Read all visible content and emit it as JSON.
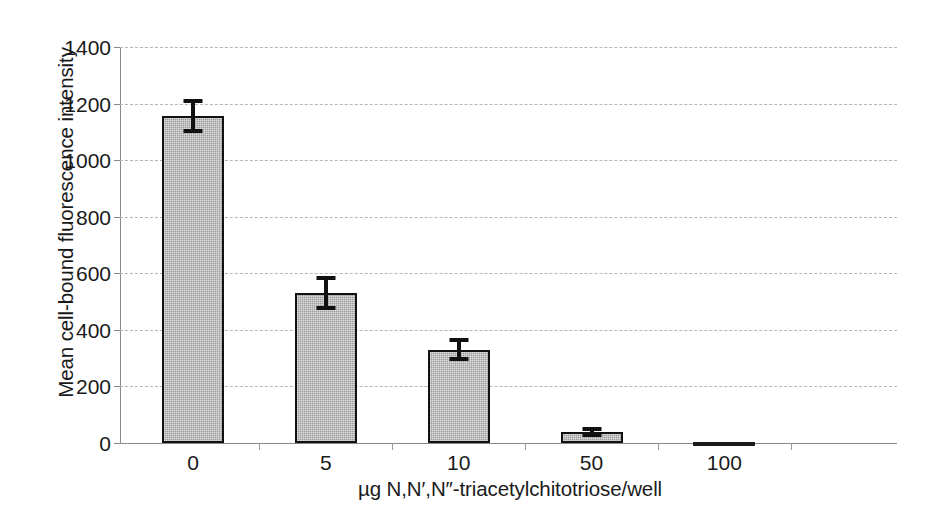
{
  "chart_data": {
    "type": "bar",
    "title": "",
    "xlabel": "µg N,N′,N″-triacetylchitotriose/well",
    "ylabel": "Mean cell-bound fluorescence intensity",
    "categories": [
      "0",
      "5",
      "10",
      "50",
      "100"
    ],
    "values": [
      1155,
      530,
      330,
      40,
      5
    ],
    "errors": [
      60,
      60,
      40,
      18,
      5
    ],
    "error_low": [
      1095,
      470,
      290,
      22,
      0
    ],
    "error_high": [
      1215,
      590,
      370,
      58,
      10
    ],
    "ylim": [
      0,
      1400
    ],
    "yticks": [
      0,
      200,
      400,
      600,
      800,
      1000,
      1200,
      1400
    ],
    "ytick_labels": [
      "0",
      "200",
      "400",
      "600",
      "800",
      "1000",
      "1200",
      "1400"
    ],
    "grid": true,
    "grid_axis": "y",
    "grid_style": "dashed",
    "legend": false,
    "legend_position": "none",
    "bar_fill_color": "#9c9c9c",
    "bar_edge_color": "#111111",
    "grid_color": "#b6b6b6",
    "axis_color": "#8a8a8a",
    "background_color": "#ffffff",
    "series": [
      {
        "name": "Mean cell-bound fluorescence intensity",
        "values": [
          1155,
          530,
          330,
          40,
          5
        ]
      }
    ]
  }
}
